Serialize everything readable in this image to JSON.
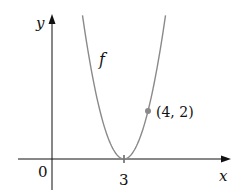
{
  "chart_data": {
    "type": "line",
    "title": "",
    "xlabel": "x",
    "ylabel": "y",
    "function_label": "f",
    "origin_label": "0",
    "x_ticks": [
      {
        "value": 3,
        "label": "3"
      }
    ],
    "y_ticks": [],
    "grid": false,
    "legend": null,
    "series": [
      {
        "name": "f",
        "description": "parabola with vertex on x-axis at x=3, passing through (4, 2)",
        "equation": "f(x) = 2(x - 3)^2",
        "x": [
          1.27,
          1.5,
          2,
          2.5,
          3,
          3.5,
          4,
          4.5,
          4.73
        ],
        "y": [
          6,
          4.5,
          2,
          0.5,
          0,
          0.5,
          2,
          4.5,
          6
        ],
        "color": "#8a8a8a"
      }
    ],
    "annotations": [
      {
        "x": 4,
        "y": 2,
        "label": "(4, 2)",
        "marker": "dot",
        "color": "#8a8a8a"
      }
    ],
    "xlim": [
      -1,
      7.3
    ],
    "ylim": [
      -1,
      6.3
    ]
  },
  "colors": {
    "axes": "#111111",
    "curve": "#8a8a8a",
    "background": "#ffffff"
  }
}
